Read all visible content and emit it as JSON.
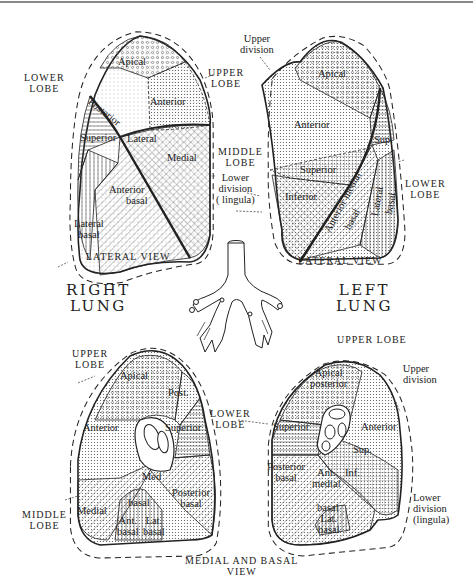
{
  "diagram": {
    "type": "anatomical-diagram",
    "sides": {
      "right": "RIGHT\nLUNG",
      "left": "LEFT\nLUNG"
    }
  },
  "headings": {
    "right_lung_line1": "RIGHT",
    "right_lung_line2": "LUNG",
    "left_lung_line1": "LEFT",
    "left_lung_line2": "LUNG"
  },
  "views": {
    "right_lateral": {
      "caption": "LATERAL VIEW",
      "lobes": {
        "upper": [
          "UPPER",
          "LOBE"
        ],
        "middle": [
          "MIDDLE",
          "LOBE"
        ],
        "lower": [
          "LOWER",
          "LOBE"
        ]
      },
      "segments": {
        "apical": "Apical",
        "posterior": "Posterior",
        "anterior": "Anterior",
        "superior": "Superior",
        "lateral": "Lateral",
        "medial": "Medial",
        "anterior_basal_1": "Anterior",
        "anterior_basal_2": "basal",
        "lateral_basal_1": "Lateral",
        "lateral_basal_2": "basal"
      }
    },
    "left_lateral": {
      "caption": "LATERAL VIEW",
      "lobes": {
        "upper_division": [
          "Upper",
          "division"
        ],
        "lower_division": [
          "Lower",
          "division",
          "( lingula)"
        ],
        "lower": [
          "LOWER",
          "LOBE"
        ]
      },
      "segments": {
        "apical": "Apical",
        "anterior": "Anterior",
        "sup": "Sup.",
        "superior": "Superior",
        "inferior": "Inferior",
        "anterior_medial_basal_1": "Anterior medial",
        "anterior_medial_basal_2": "basal",
        "lateral_basal_1": "Lateral",
        "lateral_basal_2": "basal"
      }
    },
    "right_medial": {
      "caption": "MEDIAL AND BASAL",
      "caption2": "VIEW",
      "lobes": {
        "upper": [
          "UPPER",
          "LOBE"
        ],
        "middle": [
          "MIDDLE",
          "LOBE"
        ]
      },
      "segments": {
        "apical": "Apical",
        "post": "Post.",
        "anterior": "Anterior",
        "superior": "Superior",
        "med": "Med",
        "medial": "Medial",
        "basal": "basal",
        "posterior_basal_1": "Posterior",
        "posterior_basal_2": "basal",
        "ant_basal_1": "Ant.",
        "ant_basal_2": "basal",
        "lat_basal_1": "Lat.",
        "lat_basal_2": "basal"
      }
    },
    "left_medial": {
      "lobes": {
        "upper": "UPPER LOBE",
        "upper_division": [
          "Upper",
          "division"
        ],
        "lower": [
          "LOWER",
          "LOBE"
        ],
        "lower_division": [
          "Lower",
          "division",
          "(lingula)"
        ]
      },
      "segments": {
        "apical_posterior_1": "Apical",
        "apical_posterior_2": "posterior",
        "anterior": "Anterior",
        "superior": "Superior",
        "sup": "Sup.",
        "inf": "Inf.",
        "posterior_basal_1": "Posterior",
        "posterior_basal_2": "basal",
        "ant_medial_1": "Ant.",
        "ant_medial_2": "medial",
        "basal": "basal",
        "lat_basal_1": "Lat.",
        "lat_basal_2": "basal"
      }
    }
  },
  "colors": {
    "ink": "#222222",
    "background": "#ffffff",
    "topline": "#888888"
  }
}
